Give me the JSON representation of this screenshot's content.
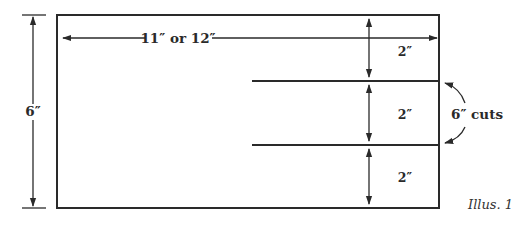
{
  "figure": {
    "caption": "Illus. 1",
    "colors": {
      "ink": "#2a2a2a",
      "background": "#ffffff"
    },
    "dimensions": {
      "width_label": "11″ or 12″",
      "height_label": "6″",
      "section_labels": [
        "2″",
        "2″",
        "2″"
      ]
    },
    "callout": {
      "label": "6″ cuts"
    }
  }
}
